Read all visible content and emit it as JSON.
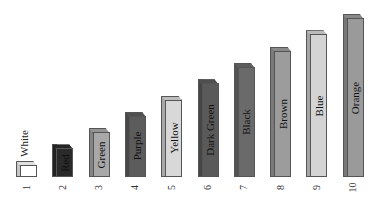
{
  "chart_data": {
    "type": "bar",
    "title": "",
    "xlabel": "",
    "ylabel": "",
    "categories": [
      "1",
      "2",
      "3",
      "4",
      "5",
      "6",
      "7",
      "8",
      "9",
      "10"
    ],
    "values": [
      1,
      2,
      3,
      4,
      5,
      6,
      7,
      8,
      9,
      10
    ],
    "bar_labels": [
      "White",
      "Red",
      "Green",
      "Purple",
      "Yellow",
      "Dark Green",
      "Black",
      "Brown",
      "Blue",
      "Orange"
    ],
    "bar_colors": [
      "#ffffff",
      "#2a2a2a",
      "#a8a8a8",
      "#5c5c5c",
      "#d8d8d8",
      "#5a5a5a",
      "#6a6a6a",
      "#9c9c9c",
      "#d4d4d4",
      "#9a9a9a"
    ],
    "style": "3d-bar, grayscale",
    "axes_visible": false,
    "grid": false,
    "legend": "none",
    "ylim": [
      0,
      10
    ]
  }
}
